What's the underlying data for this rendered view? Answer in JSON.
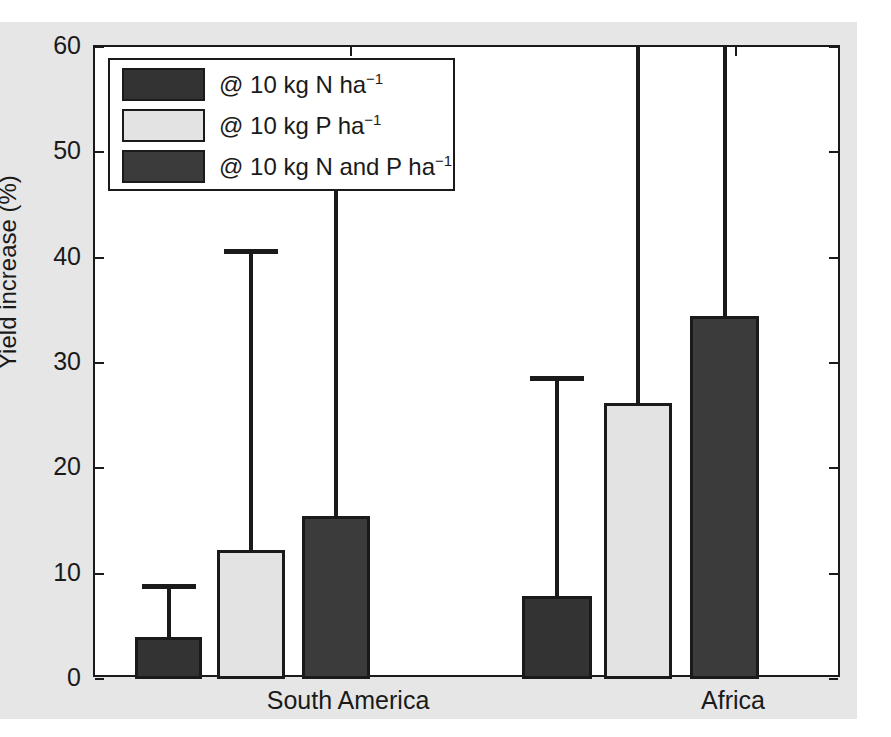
{
  "chart_data": {
    "type": "bar",
    "title": "",
    "xlabel": "",
    "ylabel": "Yield increase (%)",
    "ylim": [
      0,
      60
    ],
    "yticks": [
      0,
      10,
      20,
      30,
      40,
      50,
      60
    ],
    "ytick_labels": [
      "0",
      "10",
      "20",
      "30",
      "40",
      "50",
      "60"
    ],
    "grid": false,
    "legend_position": "upper left",
    "categories": [
      "South America",
      "Africa"
    ],
    "series": [
      {
        "name": "@ 10 kg N ha<sup>-1</sup>",
        "label_plain": "@ 10 kg N ha-1",
        "color": "#333333",
        "values": [
          4.0,
          7.9
        ],
        "errors_upper": [
          9.0,
          28.8
        ],
        "error_clipped": [
          false,
          false
        ]
      },
      {
        "name": "@ 10 kg P ha<sup>-1</sup>",
        "label_plain": "@ 10 kg P ha-1",
        "color": "#e3e3e3",
        "values": [
          12.2,
          26.2
        ],
        "errors_upper": [
          40.8,
          60.0
        ],
        "error_clipped": [
          false,
          true
        ]
      },
      {
        "name": "@ 10 kg N and P ha<sup>-1</sup>",
        "label_plain": "@ 10 kg N and P ha-1",
        "color": "#3b3b3b",
        "values": [
          15.5,
          34.5
        ],
        "errors_upper": [
          47.0,
          60.0
        ],
        "error_clipped": [
          false,
          true
        ]
      }
    ]
  },
  "axis": {
    "y_title": "Yield increase (%)",
    "tick_0": "0",
    "tick_10": "10",
    "tick_20": "20",
    "tick_30": "30",
    "tick_40": "40",
    "tick_50": "50",
    "tick_60": "60"
  },
  "xaxis": {
    "cat_1": "South America",
    "cat_2": "Africa"
  },
  "legend": {
    "item_1_prefix": "@ 10 kg N ha",
    "item_1_exp": "−1",
    "item_2_prefix": "@ 10 kg P ha",
    "item_2_exp": "−1",
    "item_3_prefix": "@ 10 kg N and P ha",
    "item_3_exp": "−1"
  },
  "colors": {
    "series_n": "#333333",
    "series_p": "#e3e3e3",
    "series_np": "#3b3b3b",
    "axis": "#1a1a1a",
    "plot_background": "#ffffff",
    "page_background": "#e6e6e6"
  }
}
